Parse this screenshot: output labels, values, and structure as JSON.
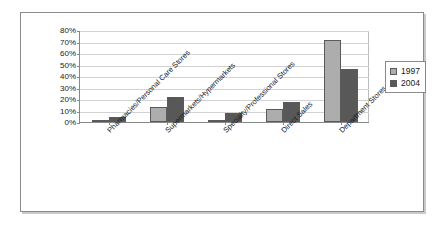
{
  "chart_data": {
    "type": "bar",
    "title": "",
    "subtitle": "",
    "xlabel": "",
    "ylabel": "",
    "ylim": [
      0,
      80
    ],
    "yticks": [
      "0%",
      "10%",
      "20%",
      "30%",
      "40%",
      "50%",
      "60%",
      "70%",
      "80%"
    ],
    "ytick_values": [
      0,
      10,
      20,
      30,
      40,
      50,
      60,
      70,
      80
    ],
    "grid": true,
    "legend_position": "right",
    "categories": [
      "Pharmacies/Personal Care Stores",
      "Supermarkets/Hypermarkets",
      "Specialty/Professional Stores",
      "Direct Sales",
      "Department Stores"
    ],
    "series": [
      {
        "name": "1997",
        "color": "#adadad",
        "values": [
          1.5,
          13,
          1.5,
          11.5,
          71
        ]
      },
      {
        "name": "2004",
        "color": "#585858",
        "values": [
          4,
          22,
          8,
          17.5,
          46
        ]
      }
    ]
  },
  "legend": {
    "items": [
      {
        "label": "1997",
        "swatch": "light-gray-swatch-icon"
      },
      {
        "label": "2004",
        "swatch": "dark-gray-swatch-icon"
      }
    ]
  },
  "colors": {
    "series_1997": "#adadad",
    "series_2004": "#585858",
    "gridline": "#d2d2d2",
    "axis": "#888888",
    "frame_border": "#8a8a8a",
    "text": "#1a1a1a",
    "background": "#ffffff"
  }
}
